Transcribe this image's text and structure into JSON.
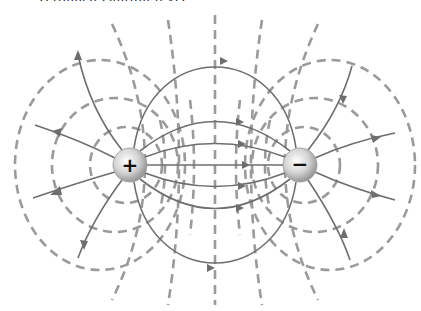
{
  "diagram": {
    "caption_fragment": "(cropped caption text)",
    "positive_charge": {
      "label": "+",
      "x": 130,
      "y": 165,
      "radius": 17
    },
    "negative_charge": {
      "label": "−",
      "x": 300,
      "y": 165,
      "radius": 17
    },
    "legend": {
      "field_lines": "solid lines with arrows (E-field, + to −)",
      "equipotentials": "dashed lines"
    },
    "colors": {
      "field_line": "#6e6e6e",
      "equipotential": "#9a9a9a",
      "charge_fill": "#d9d9d9",
      "background": "#ffffff"
    }
  }
}
